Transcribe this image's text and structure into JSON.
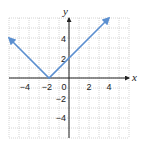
{
  "chart_data": {
    "type": "line",
    "title": "",
    "function": "y = |x + 2|",
    "xlabel": "x",
    "ylabel": "y",
    "xlim": [
      -6,
      6
    ],
    "ylim": [
      -6,
      6
    ],
    "grid": true,
    "x_ticks": [
      -4,
      -2,
      0,
      2,
      4
    ],
    "y_ticks": [
      4,
      2,
      -2,
      -4
    ],
    "series": [
      {
        "name": "y = |x + 2|",
        "color": "#5b8fd0",
        "points": [
          [
            -6,
            4
          ],
          [
            -2,
            0
          ],
          [
            4,
            6
          ]
        ],
        "arrows": "both ends"
      }
    ],
    "vertex": [
      -2,
      0
    ],
    "y_intercept": [
      0,
      2
    ]
  },
  "labels": {
    "x_axis": "x",
    "y_axis": "y",
    "xt": [
      "−4",
      "−2",
      "0",
      "2",
      "4"
    ],
    "yt": [
      "4",
      "2",
      "−2",
      "−4"
    ]
  },
  "colors": {
    "line": "#5b8fd0",
    "grid": "#b8b8b8",
    "axis": "#222222"
  }
}
